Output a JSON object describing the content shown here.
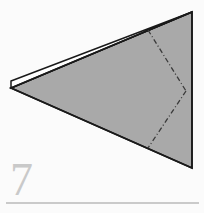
{
  "figure": {
    "kind": "origami-fold-diagram",
    "step_number": "7",
    "background_color": "#fbfbfb",
    "paper_fill_color": "#a9a9a9",
    "paper_edge_color": "#1a1a1a",
    "flap_highlight_color": "#ffffff",
    "fold_line_color": "#3a3a3a",
    "fold_line_style": "dash-dot",
    "rule_color": "#9a9a9a",
    "number_color": "#c9c9c9",
    "shapes": {
      "main_triangle": {
        "name": "main-paper-triangle",
        "points": "11,88 192,12 192,168"
      },
      "top_flap": {
        "name": "folded-flap",
        "points": "11,81 192,12 11,88"
      },
      "fold_line_upper": {
        "name": "upper-fold-crease",
        "points": "148,30 186,91"
      },
      "fold_line_lower": {
        "name": "lower-fold-crease",
        "points": "186,91 148,148"
      }
    },
    "rule": {
      "name": "bottom-divider-rule",
      "x1": 6,
      "y1": 203,
      "x2": 199,
      "y2": 203
    }
  }
}
